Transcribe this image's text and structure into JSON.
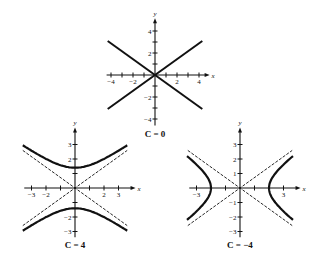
{
  "figure": {
    "panels": [
      {
        "id": "c0",
        "caption": "C = 0",
        "origin": [
          155,
          75
        ],
        "unit": 11,
        "x_ticks": [
          -4,
          -3,
          -2,
          -1,
          1,
          2,
          3,
          4
        ],
        "y_ticks": [
          -4,
          -3,
          -2,
          -1,
          1,
          2,
          3,
          4
        ],
        "x_labels": [
          "-4",
          "-2",
          "2",
          "4"
        ],
        "x_label_vals": [
          -4,
          -2,
          2,
          4
        ],
        "y_labels": [
          "4",
          "2",
          "-2",
          "-4"
        ],
        "y_label_vals": [
          4,
          2,
          -2,
          -4
        ],
        "xrange": [
          -4.4,
          4.6
        ],
        "yrange": [
          -4.6,
          4.8
        ],
        "curve": "lines",
        "asymptotes": false
      },
      {
        "id": "c4",
        "caption": "C = 4",
        "origin": [
          75,
          188
        ],
        "unit": 14.5,
        "x_ticks": [
          -3,
          -2,
          -1,
          1,
          2,
          3
        ],
        "y_ticks": [
          -3,
          -2,
          -1,
          1,
          2,
          3
        ],
        "x_labels": [
          "-3",
          "-2",
          "2",
          "3"
        ],
        "x_label_vals": [
          -3,
          -2,
          2,
          3
        ],
        "y_labels": [
          "3",
          "2",
          "-2",
          "-3"
        ],
        "y_label_vals": [
          3,
          2,
          -2,
          -3
        ],
        "xrange": [
          -3.5,
          3.9
        ],
        "yrange": [
          -3.4,
          3.9
        ],
        "curve": "hyperbola-vertical",
        "asymptotes": true
      },
      {
        "id": "cm4",
        "caption": "C = −4",
        "origin": [
          240,
          188
        ],
        "unit": 14.5,
        "x_ticks": [
          -3,
          -1,
          1,
          3
        ],
        "y_ticks": [
          -3,
          -2,
          -1,
          1,
          2,
          3
        ],
        "x_labels": [
          "-3",
          "3"
        ],
        "x_label_vals": [
          -3,
          3
        ],
        "y_labels": [
          "3",
          "2",
          "1",
          "-1",
          "-2",
          "-3"
        ],
        "y_label_vals": [
          3,
          2,
          1,
          -1,
          -2,
          -3
        ],
        "xrange": [
          -3.5,
          3.9
        ],
        "yrange": [
          -3.4,
          3.9
        ],
        "curve": "hyperbola-horizontal",
        "asymptotes": true
      }
    ],
    "axis_labels": {
      "x": "x",
      "y": "y"
    },
    "colors": {
      "ink": "#111111",
      "background": "#ffffff"
    }
  }
}
